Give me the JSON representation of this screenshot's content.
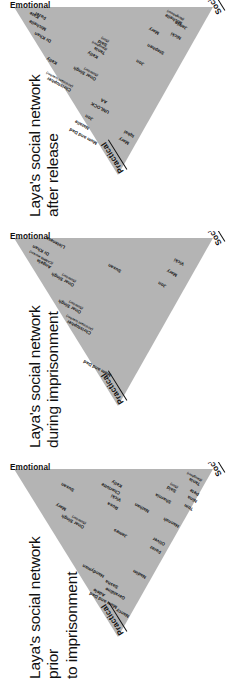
{
  "meta": {
    "figure_type": "triangular-social-network-diagrams",
    "orientation": "rotated-90-ccw",
    "triangle_fill": "#b4b4b4",
    "text_color": "#111111",
    "background": "#ffffff"
  },
  "axes": {
    "practical": "Practical",
    "emotional": "Emotional",
    "social": "Social"
  },
  "panels": [
    {
      "id": "after-release",
      "title": "Laya's social network\nafter release",
      "nodes": [
        {
          "name": "Mum and Dad",
          "sub": ""
        },
        {
          "name": "Natalie",
          "sub": ""
        },
        {
          "name": "Jon",
          "sub": ""
        },
        {
          "name": "Mary",
          "sub": ""
        },
        {
          "name": "Iqbal",
          "sub": ""
        },
        {
          "name": "UNLOCK",
          "sub": ""
        },
        {
          "name": "AA",
          "sub": ""
        },
        {
          "name": "Christopher",
          "sub": "(Assistant teacher)"
        },
        {
          "name": "Onar Singh",
          "sub": "(Solicitor)"
        },
        {
          "name": "Kelly",
          "sub": ""
        },
        {
          "name": "Kelly",
          "sub": ""
        },
        {
          "name": "Dr Khan",
          "sub": ""
        },
        {
          "name": "Michelle",
          "sub": ""
        },
        {
          "name": "Fazel",
          "sub": ""
        },
        {
          "name": "Kate",
          "sub": ""
        },
        {
          "name": "Tania",
          "sub": "(Daughter)"
        },
        {
          "name": "Said",
          "sub": "(Son)"
        },
        {
          "name": "Jon",
          "sub": ""
        },
        {
          "name": "Stephen",
          "sub": ""
        },
        {
          "name": "Nicki",
          "sub": ""
        },
        {
          "name": "Mary",
          "sub": ""
        },
        {
          "name": "Jamie",
          "sub": ""
        },
        {
          "name": "Michelle",
          "sub": "(Neighbour)"
        }
      ]
    },
    {
      "id": "during-imprisonment",
      "title": "Laya's social network\nduring imprisonment",
      "nodes": [
        {
          "name": "Mum and Dad",
          "sub": ""
        },
        {
          "name": "Christopher",
          "sub": "(Assistant teacher)"
        },
        {
          "name": "Onar Singh",
          "sub": "(Solicitor)"
        },
        {
          "name": "Onar Singh",
          "sub": "(Solicitor)"
        },
        {
          "name": "Angela",
          "sub": "(CAMHS worker)"
        },
        {
          "name": "Dr Khan",
          "sub": ""
        },
        {
          "name": "Listeners",
          "sub": ""
        },
        {
          "name": "Susan",
          "sub": ""
        },
        {
          "name": "Jon",
          "sub": ""
        },
        {
          "name": "Mary",
          "sub": ""
        },
        {
          "name": "Vicki",
          "sub": ""
        }
      ]
    },
    {
      "id": "prior-to-imprisonment",
      "title": "Laya's social network prior\nto imprisonment",
      "nodes": [
        {
          "name": "Nancy",
          "sub": ""
        },
        {
          "name": "Mum and Dad",
          "sub": ""
        },
        {
          "name": "Geraldine",
          "sub": ""
        },
        {
          "name": "Adele",
          "sub": ""
        },
        {
          "name": "Sasha",
          "sub": ""
        },
        {
          "name": "Handyman",
          "sub": ""
        },
        {
          "name": "Nadim",
          "sub": ""
        },
        {
          "name": "Faraz",
          "sub": ""
        },
        {
          "name": "Oliver",
          "sub": ""
        },
        {
          "name": "James",
          "sub": ""
        },
        {
          "name": "Onar Singh",
          "sub": "(Solicitor)"
        },
        {
          "name": "Mary",
          "sub": ""
        },
        {
          "name": "Rosa",
          "sub": ""
        },
        {
          "name": "Vicki",
          "sub": ""
        },
        {
          "name": "Charlotte",
          "sub": ""
        },
        {
          "name": "Kelly",
          "sub": ""
        },
        {
          "name": "Susan",
          "sub": ""
        },
        {
          "name": "Hannah",
          "sub": ""
        },
        {
          "name": "Nathan",
          "sub": ""
        },
        {
          "name": "Sharnia",
          "sub": ""
        },
        {
          "name": "Said",
          "sub": "(Son)"
        },
        {
          "name": "Tom",
          "sub": ""
        },
        {
          "name": "Nina",
          "sub": ""
        },
        {
          "name": "Pete",
          "sub": ""
        },
        {
          "name": "Tania",
          "sub": "(Daughter)"
        }
      ]
    }
  ],
  "layout": {
    "panel_positions": [
      {
        "id": "after-release",
        "top": 0,
        "height": 231
      },
      {
        "id": "during-imprisonment",
        "top": 231,
        "height": 231
      },
      {
        "id": "prior-to-imprisonment",
        "top": 462,
        "height": 231
      }
    ],
    "node_coords": {
      "after-release": [
        {
          "x": 86,
          "y": 96,
          "rot": -62
        },
        {
          "x": 101,
          "y": 88,
          "rot": -62
        },
        {
          "x": 110,
          "y": 92,
          "rot": -62
        },
        {
          "x": 86,
          "y": 128,
          "rot": -62
        },
        {
          "x": 93,
          "y": 133,
          "rot": -62
        },
        {
          "x": 117,
          "y": 108,
          "rot": -62
        },
        {
          "x": 127,
          "y": 106,
          "rot": -62
        },
        {
          "x": 139,
          "y": 70,
          "rot": -62
        },
        {
          "x": 150,
          "y": 95,
          "rot": -62
        },
        {
          "x": 166,
          "y": 56,
          "rot": -62
        },
        {
          "x": 172,
          "y": 97,
          "rot": -62
        },
        {
          "x": 188,
          "y": 50,
          "rot": -62
        },
        {
          "x": 200,
          "y": 45,
          "rot": -62
        },
        {
          "x": 211,
          "y": 45,
          "rot": -62
        },
        {
          "x": 212,
          "y": 38,
          "rot": -62
        },
        {
          "x": 176,
          "y": 104,
          "rot": -62
        },
        {
          "x": 184,
          "y": 106,
          "rot": -62
        },
        {
          "x": 165,
          "y": 143,
          "rot": -62
        },
        {
          "x": 176,
          "y": 163,
          "rot": -62
        },
        {
          "x": 191,
          "y": 180,
          "rot": -62
        },
        {
          "x": 196,
          "y": 158,
          "rot": -62
        },
        {
          "x": 201,
          "y": 186,
          "rot": -62
        },
        {
          "x": 206,
          "y": 181,
          "rot": -62
        }
      ],
      "during-imprisonment": [
        {
          "x": 85,
          "y": 110,
          "rot": -62
        },
        {
          "x": 127,
          "y": 90,
          "rot": -62
        },
        {
          "x": 148,
          "y": 80,
          "rot": -62
        },
        {
          "x": 175,
          "y": 73,
          "rot": -62
        },
        {
          "x": 193,
          "y": 50,
          "rot": -62
        },
        {
          "x": 206,
          "y": 48,
          "rot": -62
        },
        {
          "x": 213,
          "y": 64,
          "rot": -62
        },
        {
          "x": 189,
          "y": 120,
          "rot": -62
        },
        {
          "x": 174,
          "y": 165,
          "rot": -62
        },
        {
          "x": 185,
          "y": 176,
          "rot": -62
        },
        {
          "x": 196,
          "y": 183,
          "rot": -62
        }
      ],
      "prior-to-imprisonment": [
        {
          "x": 75,
          "y": 128,
          "rot": -62
        },
        {
          "x": 84,
          "y": 116,
          "rot": -62
        },
        {
          "x": 93,
          "y": 124,
          "rot": -62
        },
        {
          "x": 96,
          "y": 104,
          "rot": -62
        },
        {
          "x": 104,
          "y": 117,
          "rot": -62
        },
        {
          "x": 115,
          "y": 103,
          "rot": -62
        },
        {
          "x": 114,
          "y": 145,
          "rot": -62
        },
        {
          "x": 139,
          "y": 160,
          "rot": -62
        },
        {
          "x": 147,
          "y": 164,
          "rot": -62
        },
        {
          "x": 155,
          "y": 126,
          "rot": -62
        },
        {
          "x": 164,
          "y": 83,
          "rot": -62
        },
        {
          "x": 182,
          "y": 65,
          "rot": -62
        },
        {
          "x": 183,
          "y": 117,
          "rot": -62
        },
        {
          "x": 191,
          "y": 120,
          "rot": -62
        },
        {
          "x": 198,
          "y": 119,
          "rot": -62
        },
        {
          "x": 205,
          "y": 121,
          "rot": -62
        },
        {
          "x": 201,
          "y": 73,
          "rot": -62
        },
        {
          "x": 165,
          "y": 178,
          "rot": -62
        },
        {
          "x": 180,
          "y": 148,
          "rot": -62
        },
        {
          "x": 189,
          "y": 170,
          "rot": -62
        },
        {
          "x": 200,
          "y": 175,
          "rot": -62
        },
        {
          "x": 182,
          "y": 192,
          "rot": -62
        },
        {
          "x": 190,
          "y": 196,
          "rot": -62
        },
        {
          "x": 197,
          "y": 198,
          "rot": -62
        },
        {
          "x": 207,
          "y": 199,
          "rot": -62
        }
      ]
    }
  }
}
